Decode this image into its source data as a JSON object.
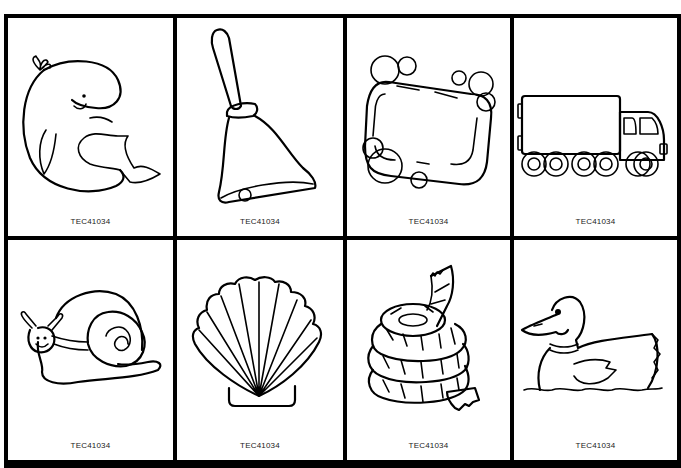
{
  "sheet": {
    "cards": [
      {
        "picture": "whale",
        "code": "TEC41034"
      },
      {
        "picture": "bell",
        "code": "TEC41034"
      },
      {
        "picture": "soap",
        "code": "TEC41034"
      },
      {
        "picture": "truck",
        "code": "TEC41034"
      },
      {
        "picture": "snail",
        "code": "TEC41034"
      },
      {
        "picture": "seashell",
        "code": "TEC41034"
      },
      {
        "picture": "rope",
        "code": "TEC41034"
      },
      {
        "picture": "duck",
        "code": "TEC41034"
      }
    ]
  }
}
